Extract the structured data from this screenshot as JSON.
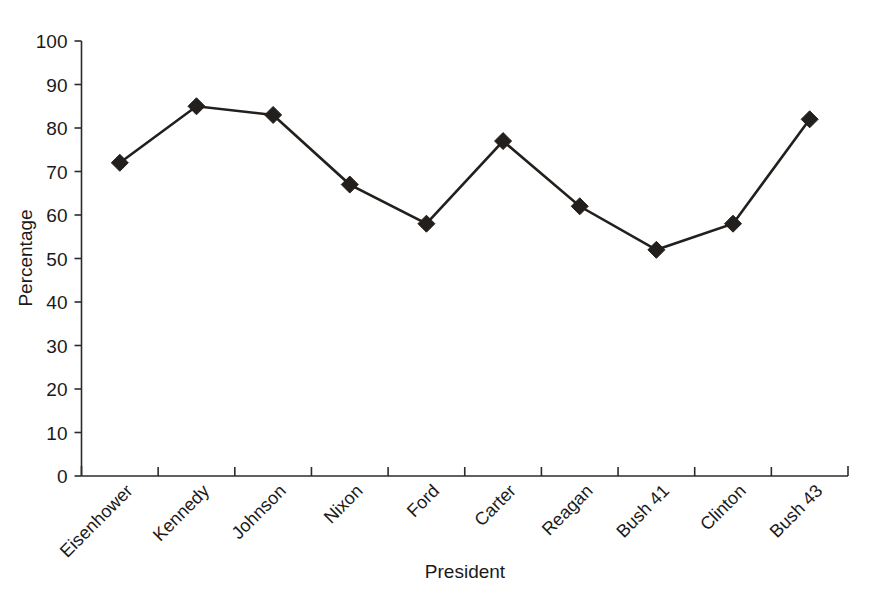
{
  "chart_data": {
    "type": "line",
    "title": "",
    "xlabel": "President",
    "ylabel": "Percentage",
    "categories": [
      "Eisenhower",
      "Kennedy",
      "Johnson",
      "Nixon",
      "Ford",
      "Carter",
      "Reagan",
      "Bush 41",
      "Clinton",
      "Bush 43"
    ],
    "values": [
      72,
      85,
      83,
      67,
      58,
      77,
      62,
      52,
      58,
      82
    ],
    "series": [
      {
        "name": "Percentage",
        "values": [
          72,
          85,
          83,
          67,
          58,
          77,
          62,
          52,
          58,
          82
        ]
      }
    ],
    "ylim": [
      0,
      100
    ],
    "ytick_labels": [
      "0",
      "10",
      "20",
      "30",
      "40",
      "50",
      "60",
      "70",
      "80",
      "90",
      "100"
    ],
    "ytick_values": [
      0,
      10,
      20,
      30,
      40,
      50,
      60,
      70,
      80,
      90,
      100
    ],
    "grid": false,
    "legend": "none",
    "marker": "diamond",
    "line_color": "#231f1c",
    "marker_color": "#231f1c",
    "background_color": "#ffffff",
    "axis_color": "#2b2b2b",
    "xtick_label_rotation": -45
  }
}
